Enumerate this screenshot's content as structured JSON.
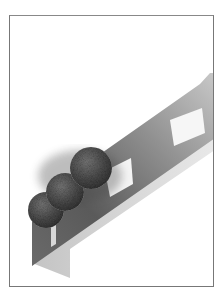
{
  "image": {
    "description": "Grayscale 3D render of a tilted gray beam with white rectangular cutouts and three textured spheres, inside a thin rectangular frame",
    "colors": {
      "background": "#ffffff",
      "frame_border": "#777777",
      "beam_light": "#9a9a9a",
      "beam_dark": "#4a4a4a",
      "sphere": "#555555",
      "hole": "#f4f4f4"
    },
    "objects": [
      {
        "name": "beam",
        "count": 1
      },
      {
        "name": "sphere",
        "count": 3
      },
      {
        "name": "window-cutout",
        "count": 3
      }
    ]
  }
}
